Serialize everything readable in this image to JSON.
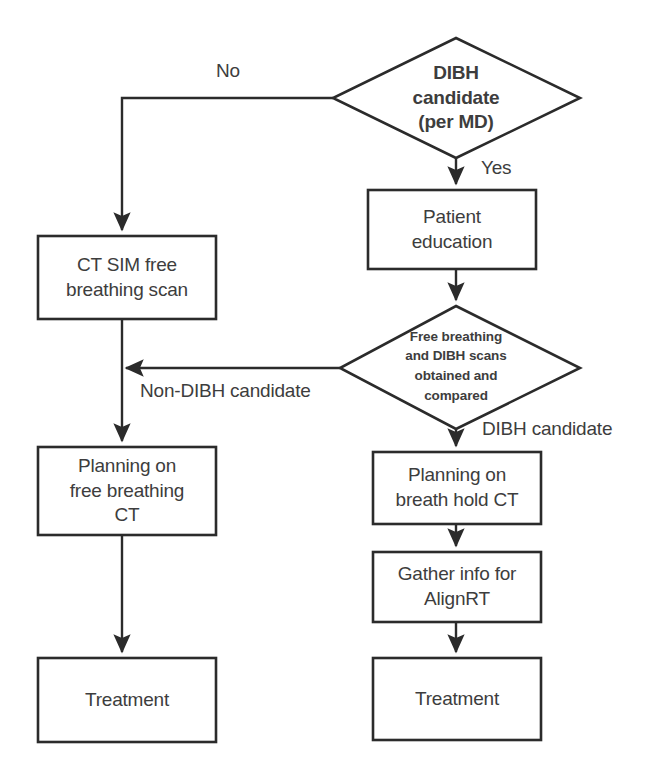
{
  "diagram": {
    "stroke_color": "#2b2b2b",
    "text_color": "#3d3d3d",
    "background_color": "#ffffff",
    "nodes": [
      {
        "id": "dibh-candidate-decision",
        "shape": "diamond",
        "label": "DIBH\ncandidate\n(per MD)"
      },
      {
        "id": "ct-sim-free-breathing-scan",
        "shape": "process",
        "label": "CT SIM free\nbreathing scan"
      },
      {
        "id": "patient-education",
        "shape": "process",
        "label": "Patient\neducation"
      },
      {
        "id": "scans-obtained-compared-decision",
        "shape": "diamond",
        "label": "Free breathing\nand DIBH scans\nobtained and\ncompared"
      },
      {
        "id": "planning-free-breathing-ct",
        "shape": "process",
        "label": "Planning on\nfree breathing\nCT"
      },
      {
        "id": "planning-breath-hold-ct",
        "shape": "process",
        "label": "Planning on\nbreath hold CT"
      },
      {
        "id": "gather-info-alignrt",
        "shape": "process",
        "label": "Gather info for\nAlignRT"
      },
      {
        "id": "treatment-free-breathing",
        "shape": "process",
        "label": "Treatment"
      },
      {
        "id": "treatment-breath-hold",
        "shape": "process",
        "label": "Treatment"
      }
    ],
    "edge_labels": [
      {
        "id": "edge-no",
        "label": "No"
      },
      {
        "id": "edge-yes",
        "label": "Yes"
      },
      {
        "id": "edge-non-dibh-candidate",
        "label": "Non-DIBH candidate"
      },
      {
        "id": "edge-dibh-candidate",
        "label": "DIBH candidate"
      }
    ]
  }
}
